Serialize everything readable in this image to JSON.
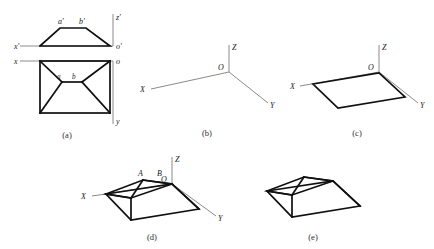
{
  "figure": {
    "background_color": "#ffffff",
    "object_line_color": "#101010",
    "axis_line_color": "#8a8a8a",
    "text_color": "#1a1a1a",
    "panels": [
      {
        "id": "a",
        "caption": "(a)",
        "description": "Orthographic two-view drawing: top view trapezoid and front view rectangle with diagonals",
        "labels": [
          {
            "name": "x-prime-axis-label",
            "text": "x′"
          },
          {
            "name": "z-prime-axis-label",
            "text": "z′"
          },
          {
            "name": "o-prime-origin-label",
            "text": "o′"
          },
          {
            "name": "a-prime-point-label",
            "text": "a′"
          },
          {
            "name": "b-prime-point-label",
            "text": "b′"
          },
          {
            "name": "x-axis-label",
            "text": "x"
          },
          {
            "name": "o-origin-label",
            "text": "o"
          },
          {
            "name": "y-axis-label",
            "text": "y"
          },
          {
            "name": "a-point-label",
            "text": "a"
          },
          {
            "name": "b-point-label",
            "text": "b"
          }
        ]
      },
      {
        "id": "b",
        "caption": "(b)",
        "description": "Bare axonometric coordinate axes",
        "labels": [
          {
            "name": "x-axis-label",
            "text": "X"
          },
          {
            "name": "y-axis-label",
            "text": "Y"
          },
          {
            "name": "z-axis-label",
            "text": "Z"
          },
          {
            "name": "origin-label",
            "text": "O"
          }
        ]
      },
      {
        "id": "c",
        "caption": "(c)",
        "description": "Base parallelogram drawn on the axonometric axes",
        "labels": [
          {
            "name": "x-axis-label",
            "text": "X"
          },
          {
            "name": "y-axis-label",
            "text": "Y"
          },
          {
            "name": "z-axis-label",
            "text": "Z"
          },
          {
            "name": "origin-label",
            "text": "O"
          }
        ]
      },
      {
        "id": "d",
        "caption": "(d)",
        "description": "Completed hip-roof solid with ridge A-B shown together with the axes",
        "labels": [
          {
            "name": "x-axis-label",
            "text": "X"
          },
          {
            "name": "y-axis-label",
            "text": "Y"
          },
          {
            "name": "z-axis-label",
            "text": "Z"
          },
          {
            "name": "origin-label",
            "text": "O"
          },
          {
            "name": "ridge-point-a-label",
            "text": "A"
          },
          {
            "name": "ridge-point-b-label",
            "text": "B"
          }
        ]
      },
      {
        "id": "e",
        "caption": "(e)",
        "description": "Final hip-roof solid without construction axes",
        "labels": []
      }
    ]
  }
}
